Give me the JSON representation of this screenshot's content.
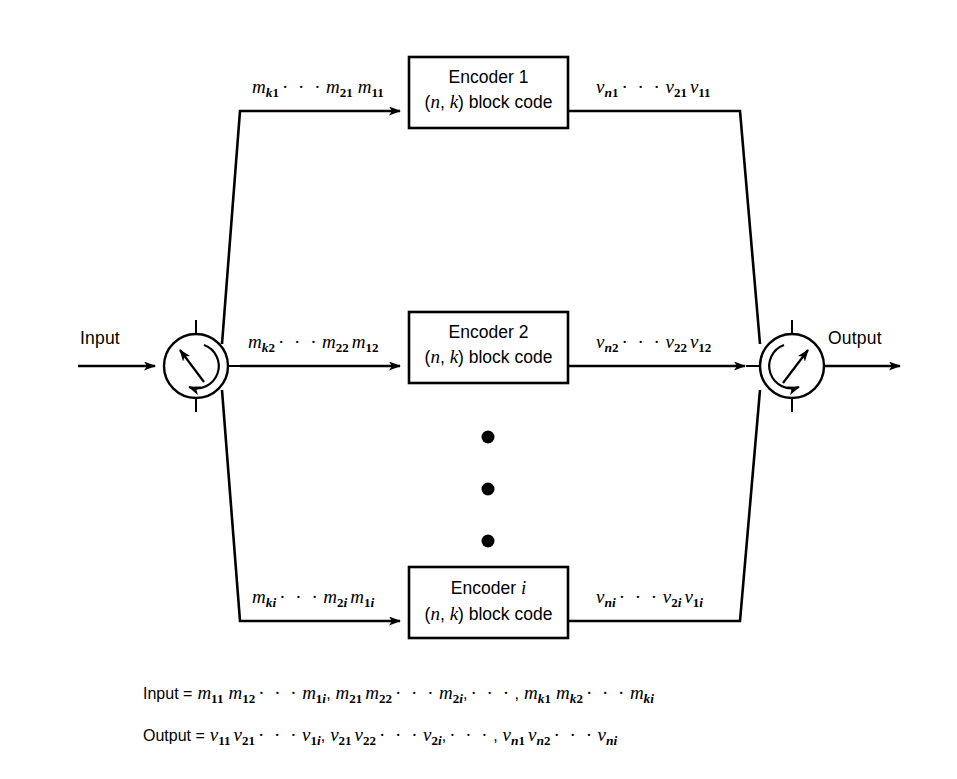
{
  "figure": {
    "type": "block-diagram",
    "input_label": "Input",
    "output_label": "Output",
    "vertical_dots_count": 3
  },
  "branches": [
    {
      "id": "branch-1",
      "encoder_title": "Encoder 1",
      "encoder_subtitle": "(n, k) block code",
      "encoder_index": "1",
      "input_signal": {
        "symbol": "m",
        "terms": [
          "m_k1",
          "m_21",
          "m_11"
        ]
      },
      "output_signal": {
        "symbol": "v",
        "terms": [
          "v_n1",
          "v_21",
          "v_11"
        ]
      }
    },
    {
      "id": "branch-2",
      "encoder_title": "Encoder 2",
      "encoder_subtitle": "(n, k) block code",
      "encoder_index": "2",
      "input_signal": {
        "symbol": "m",
        "terms": [
          "m_k2",
          "m_22",
          "m_12"
        ]
      },
      "output_signal": {
        "symbol": "v",
        "terms": [
          "v_n2",
          "v_22",
          "v_12"
        ]
      }
    },
    {
      "id": "branch-i",
      "encoder_title": "Encoder i",
      "encoder_subtitle": "(n, k) block code",
      "encoder_index": "i",
      "input_signal": {
        "symbol": "m",
        "terms": [
          "m_ki",
          "m_2i",
          "m_1i"
        ]
      },
      "output_signal": {
        "symbol": "v",
        "terms": [
          "v_ni",
          "v_2i",
          "v_1i"
        ]
      }
    }
  ],
  "captions": {
    "input_line_prefix": "Input =",
    "input_line_sequence": "m11 m12 ... m1i, m21 m22 ... m2i, ..., mk1 mk2 ... mki",
    "output_line_prefix": "Output =",
    "output_line_sequence": "v11 v21 ... v1i, v21 v22 ... v2i, ..., vn1 vn2 ... vni"
  },
  "switches": {
    "input_commutator": "rotary-commutator-switch",
    "output_commutator": "rotary-commutator-switch"
  },
  "colors": {
    "background": "#ffffff",
    "stroke": "#000000",
    "text": "#000000"
  }
}
